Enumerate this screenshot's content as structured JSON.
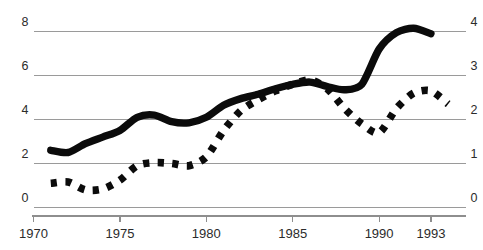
{
  "chart_data": {
    "type": "line",
    "title": "",
    "subtitle": "",
    "xlabel": "",
    "ylabel": "",
    "grid": true,
    "legend": "none",
    "x": [
      1970,
      1975,
      1980,
      1985,
      1990,
      1993
    ],
    "xlim": [
      1970,
      1995
    ],
    "x_tick_labels": [
      "1970",
      "1975",
      "1980",
      "1985",
      "1990",
      "1993"
    ],
    "axes": [
      {
        "id": "left",
        "position": "left",
        "ylim": [
          0,
          8
        ],
        "ticks": [
          0,
          2,
          4,
          6,
          8
        ],
        "tick_labels": [
          "0",
          "2",
          "4",
          "6",
          "8"
        ]
      },
      {
        "id": "right",
        "position": "right",
        "ylim": [
          0,
          4
        ],
        "ticks": [
          0,
          1,
          2,
          3,
          4
        ],
        "tick_labels": [
          "0",
          "1",
          "2",
          "3",
          "4"
        ]
      }
    ],
    "series": [
      {
        "name": "solid-series",
        "style": "solid",
        "axis": "left",
        "color": "#0b0b0b",
        "x": [
          1971,
          1972,
          1973,
          1974,
          1975,
          1976,
          1977,
          1978,
          1979,
          1980,
          1981,
          1982,
          1983,
          1984,
          1985,
          1986,
          1987,
          1988,
          1989,
          1990,
          1991,
          1992,
          1993
        ],
        "values": [
          2.6,
          2.5,
          2.9,
          3.2,
          3.5,
          4.1,
          4.2,
          3.9,
          3.85,
          4.1,
          4.65,
          4.95,
          5.15,
          5.4,
          5.6,
          5.7,
          5.5,
          5.35,
          5.6,
          7.2,
          7.95,
          8.15,
          7.9
        ]
      },
      {
        "name": "dotted-series",
        "style": "dotted",
        "axis": "right",
        "color": "#0b0b0b",
        "x": [
          1971,
          1972,
          1973,
          1974,
          1975,
          1976,
          1977,
          1978,
          1979,
          1980,
          1981,
          1982,
          1983,
          1984,
          1985,
          1986,
          1987,
          1988,
          1989,
          1990,
          1991,
          1992,
          1993,
          1994
        ],
        "values": [
          0.55,
          0.58,
          0.4,
          0.42,
          0.62,
          0.95,
          1.02,
          1.0,
          0.95,
          1.15,
          1.75,
          2.2,
          2.45,
          2.65,
          2.8,
          2.9,
          2.7,
          2.25,
          1.9,
          1.7,
          2.25,
          2.6,
          2.65,
          2.35
        ]
      }
    ]
  }
}
